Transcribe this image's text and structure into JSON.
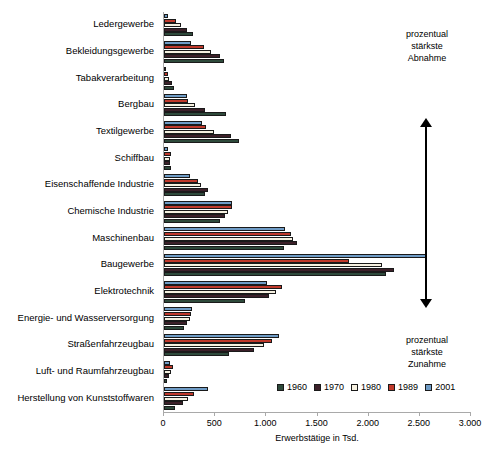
{
  "chart_data": {
    "type": "bar",
    "orientation": "horizontal",
    "title": "",
    "xlabel": "Erwerbstätige in Tsd.",
    "ylabel": "",
    "xlim": [
      0,
      3000
    ],
    "xticks": [
      0,
      500,
      1000,
      1500,
      2000,
      2500,
      3000
    ],
    "xtick_labels": [
      "0",
      "500",
      "1.000",
      "1.500",
      "2.000",
      "2.500",
      "3.000"
    ],
    "grid": false,
    "legend_position": "bottom-right",
    "categories": [
      "Ledergewerbe",
      "Bekleidungsgewerbe",
      "Tabakverarbeitung",
      "Bergbau",
      "Textilgewerbe",
      "Schiffbau",
      "Eisenschaffende Industrie",
      "Chemische Industrie",
      "Maschinenbau",
      "Baugewerbe",
      "Elektrotechnik",
      "Energie- und Wasserversorgung",
      "Straßenfahrzeugbau",
      "Luft- und Raumfahrzeugbau",
      "Herstellung von Kunststoffwaren"
    ],
    "series": [
      {
        "name": "1960",
        "color": "#2e4a3b",
        "values": [
          285,
          590,
          95,
          610,
          730,
          65,
          400,
          545,
          1170,
          2170,
          790,
          195,
          635,
          25,
          110
        ]
      },
      {
        "name": "1970",
        "color": "#3c2029",
        "values": [
          225,
          545,
          80,
          400,
          655,
          55,
          430,
          600,
          1300,
          2250,
          1030,
          225,
          880,
          45,
          190
        ]
      },
      {
        "name": "1980",
        "color": "#f6f1e1",
        "values": [
          165,
          460,
          45,
          300,
          490,
          60,
          365,
          625,
          1265,
          2130,
          1090,
          250,
          975,
          70,
          235
        ]
      },
      {
        "name": "1989",
        "color": "#c0392b",
        "values": [
          115,
          390,
          35,
          235,
          410,
          70,
          335,
          660,
          1245,
          1810,
          1150,
          265,
          1055,
          90,
          290
        ]
      },
      {
        "name": "2001",
        "color": "#6f9cc6",
        "values": [
          40,
          260,
          20,
          225,
          370,
          35,
          250,
          660,
          1185,
          2560,
          1005,
          270,
          1120,
          55,
          430
        ]
      }
    ],
    "annotations": [
      {
        "id": "top",
        "lines": [
          "prozentual",
          "stärkste",
          "Abnahme"
        ]
      },
      {
        "id": "bottom",
        "lines": [
          "prozentual",
          "stärkste",
          "Zunahme"
        ]
      }
    ],
    "arrow": {
      "direction": "double-vertical",
      "name": "trend-arrow"
    }
  }
}
